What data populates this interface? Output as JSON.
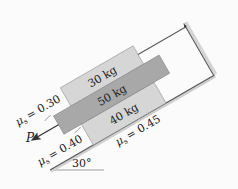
{
  "diagram": {
    "blocks": [
      {
        "id": "top",
        "mass_label": "30 kg",
        "color": "#d6d6d6"
      },
      {
        "id": "middle",
        "mass_label": "50 kg",
        "color": "#a8a8a8"
      },
      {
        "id": "bottom",
        "mass_label": "40 kg",
        "color": "#d6d6d6"
      }
    ],
    "friction": [
      {
        "label": "μs = 0.30",
        "between": "top and middle"
      },
      {
        "label": "μs = 0.40",
        "between": "middle and bottom"
      },
      {
        "label": "μs = 0.45",
        "between": "bottom and incline"
      }
    ],
    "force": {
      "label": "P"
    },
    "angle": {
      "label": "30°"
    },
    "mu_symbol": "μ",
    "mu_sub": "s",
    "mu_values": [
      "= 0.30",
      "= 0.40",
      "= 0.45"
    ]
  }
}
